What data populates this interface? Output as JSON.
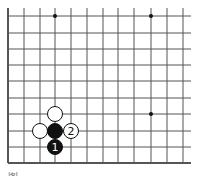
{
  "diagram": {
    "type": "go-board-fragment",
    "grid": {
      "x_lines": [
        8,
        24,
        40,
        55,
        71,
        87,
        103,
        118,
        134,
        151,
        167,
        183
      ],
      "y_lines": [
        16,
        33,
        49,
        65,
        81,
        98,
        114,
        131,
        147,
        163
      ],
      "x_end": 191,
      "y_start": 8,
      "left_edge_thick": true,
      "bottom_edge_thick": true,
      "line_color": "#555555"
    },
    "star_points": [
      {
        "x": 55,
        "y": 16
      },
      {
        "x": 151,
        "y": 16
      },
      {
        "x": 151,
        "y": 114
      }
    ],
    "stones": [
      {
        "color": "white",
        "x": 55,
        "y": 114,
        "label": ""
      },
      {
        "color": "white",
        "x": 40,
        "y": 131,
        "label": ""
      },
      {
        "color": "black",
        "x": 55,
        "y": 131,
        "label": ""
      },
      {
        "color": "white",
        "x": 71,
        "y": 131,
        "label": "2"
      },
      {
        "color": "black",
        "x": 55,
        "y": 147,
        "label": "1"
      }
    ],
    "stone_radius": 7.5
  },
  "caption": {
    "text": "图"
  }
}
